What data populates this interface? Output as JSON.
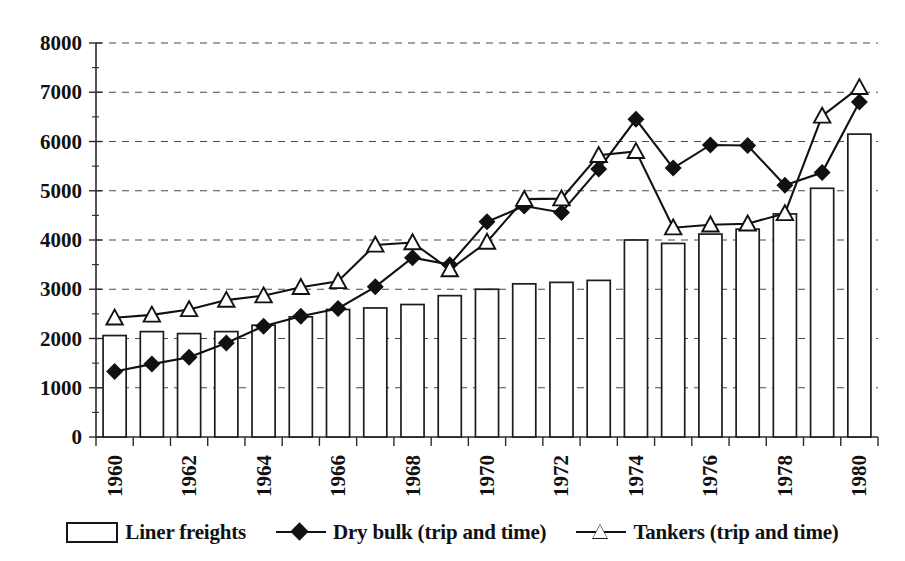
{
  "chart_data": {
    "type": "bar",
    "title": "",
    "xlabel": "",
    "ylabel": "",
    "ylim": [
      0,
      8000
    ],
    "ytick_step": 1000,
    "grid": true,
    "legend_position": "bottom",
    "x": [
      1960,
      1961,
      1962,
      1963,
      1964,
      1965,
      1966,
      1967,
      1968,
      1969,
      1970,
      1971,
      1972,
      1973,
      1974,
      1975,
      1976,
      1977,
      1978,
      1979,
      1980
    ],
    "categories": [
      "1960",
      "1961",
      "1962",
      "1963",
      "1964",
      "1965",
      "1966",
      "1967",
      "1968",
      "1969",
      "1970",
      "1971",
      "1972",
      "1973",
      "1974",
      "1975",
      "1976",
      "1977",
      "1978",
      "1979",
      "1980"
    ],
    "xtick_labels_shown": [
      "1960",
      "1962",
      "1964",
      "1966",
      "1968",
      "1970",
      "1972",
      "1974",
      "1976",
      "1978",
      "1980"
    ],
    "ytick_labels": [
      "0",
      "1000",
      "2000",
      "3000",
      "4000",
      "5000",
      "6000",
      "7000",
      "8000"
    ],
    "series": [
      {
        "name": "Liner freights",
        "type": "bar",
        "marker": "none",
        "values": [
          2060,
          2140,
          2100,
          2140,
          2270,
          2440,
          2590,
          2620,
          2690,
          2870,
          3000,
          3110,
          3140,
          3180,
          4000,
          3930,
          4120,
          4220,
          4530,
          5050,
          6150
        ]
      },
      {
        "name": "Dry bulk (trip and time)",
        "type": "line",
        "marker": "diamond",
        "values": [
          1330,
          1480,
          1620,
          1910,
          2250,
          2450,
          2610,
          3050,
          3640,
          3500,
          4370,
          4690,
          4560,
          5440,
          6450,
          5460,
          5930,
          5920,
          5110,
          5370,
          6800
        ]
      },
      {
        "name": "Tankers (trip and time)",
        "type": "line",
        "marker": "triangle",
        "values": [
          2420,
          2480,
          2590,
          2780,
          2870,
          3040,
          3160,
          3900,
          3950,
          3400,
          3960,
          4830,
          4840,
          5720,
          5800,
          4250,
          4310,
          4330,
          4540,
          6520,
          7100
        ]
      }
    ]
  },
  "legend": {
    "items": [
      {
        "label": "Liner freights",
        "marker": "bar-swatch"
      },
      {
        "label": "Dry bulk (trip and time)",
        "marker": "diamond-line"
      },
      {
        "label": "Tankers (trip and time)",
        "marker": "triangle-line"
      }
    ]
  }
}
